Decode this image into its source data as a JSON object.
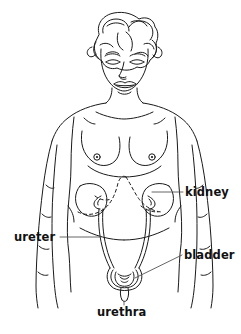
{
  "diagram": {
    "background_color": "#ffffff",
    "line_color": "#1a1a1a",
    "text_color": "#111111",
    "labels": [
      {
        "id": "kidney",
        "text": "kidney",
        "side": "right"
      },
      {
        "id": "ureter",
        "text": "ureter",
        "side": "left"
      },
      {
        "id": "bladder",
        "text": "bladder",
        "side": "right"
      },
      {
        "id": "urethra",
        "text": "urethra",
        "side": "bottom"
      }
    ],
    "organs": [
      {
        "id": "kidney-left",
        "name": "kidney"
      },
      {
        "id": "kidney-right",
        "name": "kidney"
      },
      {
        "id": "ureter-left",
        "name": "ureter"
      },
      {
        "id": "ureter-right",
        "name": "ureter"
      },
      {
        "id": "bladder",
        "name": "bladder"
      },
      {
        "id": "urethra",
        "name": "urethra"
      }
    ],
    "body_parts": [
      {
        "id": "head",
        "name": "head"
      },
      {
        "id": "hair",
        "name": "hair"
      },
      {
        "id": "face",
        "name": "face"
      },
      {
        "id": "neck",
        "name": "neck"
      },
      {
        "id": "torso",
        "name": "torso"
      },
      {
        "id": "arm-left",
        "name": "arm"
      },
      {
        "id": "arm-right",
        "name": "arm"
      },
      {
        "id": "breast-left",
        "name": "breast"
      },
      {
        "id": "breast-right",
        "name": "breast"
      },
      {
        "id": "hips",
        "name": "hips"
      }
    ]
  }
}
